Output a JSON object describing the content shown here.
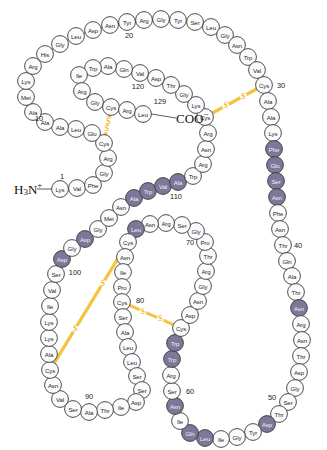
{
  "figure": {
    "molecule": "Lysozyme primary structure",
    "n_terminus_label": "H",
    "n_terminus_sub": "3",
    "n_terminus_rest": "N",
    "n_terminus_sup": "+",
    "c_terminus_label": "COO",
    "c_terminus_sup": "−",
    "disulfide_letter": "S"
  },
  "chart_data": {
    "type": "diagram",
    "residue_count": 129,
    "highlight_color": "#7d7799",
    "plain_color": "#fbfbfd",
    "disulfide_color": "#f5c33f",
    "sequence": [
      {
        "n": 1,
        "aa": "Lys",
        "hl": false,
        "x": 60,
        "y": 189
      },
      {
        "n": 2,
        "aa": "Val",
        "hl": false,
        "x": 77,
        "y": 188
      },
      {
        "n": 3,
        "aa": "Phe",
        "hl": false,
        "x": 93,
        "y": 185
      },
      {
        "n": 4,
        "aa": "Gly",
        "hl": false,
        "x": 104,
        "y": 173
      },
      {
        "n": 5,
        "aa": "Arg",
        "hl": false,
        "x": 108,
        "y": 158
      },
      {
        "n": 6,
        "aa": "Cys",
        "hl": false,
        "x": 104,
        "y": 143
      },
      {
        "n": 7,
        "aa": "Glu",
        "hl": false,
        "x": 92,
        "y": 133
      },
      {
        "n": 8,
        "aa": "Leu",
        "hl": false,
        "x": 76,
        "y": 129
      },
      {
        "n": 9,
        "aa": "Ala",
        "hl": false,
        "x": 60,
        "y": 127
      },
      {
        "n": 10,
        "aa": "Ala",
        "hl": false,
        "x": 45,
        "y": 122
      },
      {
        "n": 11,
        "aa": "Ala",
        "hl": false,
        "x": 33,
        "y": 112
      },
      {
        "n": 12,
        "aa": "Met",
        "hl": false,
        "x": 26,
        "y": 97
      },
      {
        "n": 13,
        "aa": "Lys",
        "hl": false,
        "x": 26,
        "y": 81
      },
      {
        "n": 14,
        "aa": "Arg",
        "hl": false,
        "x": 33,
        "y": 66
      },
      {
        "n": 15,
        "aa": "His",
        "hl": false,
        "x": 45,
        "y": 54
      },
      {
        "n": 16,
        "aa": "Gly",
        "hl": false,
        "x": 60,
        "y": 44
      },
      {
        "n": 17,
        "aa": "Leu",
        "hl": false,
        "x": 76,
        "y": 36
      },
      {
        "n": 18,
        "aa": "Asp",
        "hl": false,
        "x": 93,
        "y": 30
      },
      {
        "n": 19,
        "aa": "Asn",
        "hl": false,
        "x": 110,
        "y": 25
      },
      {
        "n": 20,
        "aa": "Tyr",
        "hl": false,
        "x": 127,
        "y": 22
      },
      {
        "n": 21,
        "aa": "Arg",
        "hl": false,
        "x": 144,
        "y": 20
      },
      {
        "n": 22,
        "aa": "Gly",
        "hl": false,
        "x": 161,
        "y": 19
      },
      {
        "n": 23,
        "aa": "Tyr",
        "hl": false,
        "x": 178,
        "y": 20
      },
      {
        "n": 24,
        "aa": "Ser",
        "hl": false,
        "x": 195,
        "y": 22
      },
      {
        "n": 25,
        "aa": "Leu",
        "hl": false,
        "x": 211,
        "y": 27
      },
      {
        "n": 26,
        "aa": "Gly",
        "hl": false,
        "x": 225,
        "y": 35
      },
      {
        "n": 27,
        "aa": "Asn",
        "hl": false,
        "x": 237,
        "y": 45
      },
      {
        "n": 28,
        "aa": "Trp",
        "hl": false,
        "x": 248,
        "y": 57
      },
      {
        "n": 29,
        "aa": "Val",
        "hl": false,
        "x": 257,
        "y": 70
      },
      {
        "n": 30,
        "aa": "Cys",
        "hl": false,
        "x": 264,
        "y": 85
      },
      {
        "n": 31,
        "aa": "Ala",
        "hl": false,
        "x": 268,
        "y": 101
      },
      {
        "n": 32,
        "aa": "Ala",
        "hl": false,
        "x": 271,
        "y": 117
      },
      {
        "n": 33,
        "aa": "Lys",
        "hl": false,
        "x": 273,
        "y": 133
      },
      {
        "n": 34,
        "aa": "Phe",
        "hl": true,
        "x": 274,
        "y": 149
      },
      {
        "n": 35,
        "aa": "Glu",
        "hl": true,
        "x": 275,
        "y": 165
      },
      {
        "n": 36,
        "aa": "Ser",
        "hl": true,
        "x": 276,
        "y": 181
      },
      {
        "n": 37,
        "aa": "Asn",
        "hl": true,
        "x": 277,
        "y": 197
      },
      {
        "n": 38,
        "aa": "Phe",
        "hl": false,
        "x": 278,
        "y": 213
      },
      {
        "n": 39,
        "aa": "Asn",
        "hl": false,
        "x": 280,
        "y": 229
      },
      {
        "n": 40,
        "aa": "Thr",
        "hl": false,
        "x": 283,
        "y": 245
      },
      {
        "n": 41,
        "aa": "Gln",
        "hl": false,
        "x": 287,
        "y": 261
      },
      {
        "n": 42,
        "aa": "Ala",
        "hl": false,
        "x": 292,
        "y": 276
      },
      {
        "n": 43,
        "aa": "Thr",
        "hl": false,
        "x": 296,
        "y": 292
      },
      {
        "n": 44,
        "aa": "Asn",
        "hl": true,
        "x": 299,
        "y": 308
      },
      {
        "n": 45,
        "aa": "Arg",
        "hl": false,
        "x": 301,
        "y": 324
      },
      {
        "n": 46,
        "aa": "Asn",
        "hl": false,
        "x": 302,
        "y": 340
      },
      {
        "n": 47,
        "aa": "Thr",
        "hl": false,
        "x": 301,
        "y": 356
      },
      {
        "n": 48,
        "aa": "Asp",
        "hl": false,
        "x": 299,
        "y": 372
      },
      {
        "n": 49,
        "aa": "Gly",
        "hl": false,
        "x": 295,
        "y": 388
      },
      {
        "n": 50,
        "aa": "Ser",
        "hl": false,
        "x": 288,
        "y": 402
      },
      {
        "n": 51,
        "aa": "Thr",
        "hl": false,
        "x": 279,
        "y": 414
      },
      {
        "n": 52,
        "aa": "Asp",
        "hl": true,
        "x": 267,
        "y": 424
      },
      {
        "n": 53,
        "aa": "Tyr",
        "hl": false,
        "x": 253,
        "y": 432
      },
      {
        "n": 54,
        "aa": "Gly",
        "hl": false,
        "x": 237,
        "y": 437
      },
      {
        "n": 55,
        "aa": "Ile",
        "hl": false,
        "x": 221,
        "y": 439
      },
      {
        "n": 56,
        "aa": "Leu",
        "hl": true,
        "x": 205,
        "y": 438
      },
      {
        "n": 57,
        "aa": "Gln",
        "hl": true,
        "x": 190,
        "y": 433
      },
      {
        "n": 58,
        "aa": "Ile",
        "hl": false,
        "x": 180,
        "y": 421
      },
      {
        "n": 59,
        "aa": "Asn",
        "hl": true,
        "x": 175,
        "y": 406
      },
      {
        "n": 60,
        "aa": "Ser",
        "hl": false,
        "x": 172,
        "y": 391
      },
      {
        "n": 61,
        "aa": "Arg",
        "hl": false,
        "x": 171,
        "y": 375
      },
      {
        "n": 62,
        "aa": "Trp",
        "hl": true,
        "x": 172,
        "y": 359
      },
      {
        "n": 63,
        "aa": "Trp",
        "hl": true,
        "x": 175,
        "y": 343
      },
      {
        "n": 64,
        "aa": "Cys",
        "hl": false,
        "x": 181,
        "y": 328
      },
      {
        "n": 65,
        "aa": "Asp",
        "hl": false,
        "x": 190,
        "y": 315
      },
      {
        "n": 66,
        "aa": "Asn",
        "hl": false,
        "x": 198,
        "y": 301
      },
      {
        "n": 67,
        "aa": "Gly",
        "hl": false,
        "x": 203,
        "y": 286
      },
      {
        "n": 68,
        "aa": "Arg",
        "hl": false,
        "x": 206,
        "y": 271
      },
      {
        "n": 69,
        "aa": "Thr",
        "hl": false,
        "x": 208,
        "y": 256
      },
      {
        "n": 70,
        "aa": "Pro",
        "hl": false,
        "x": 205,
        "y": 242
      },
      {
        "n": 71,
        "aa": "Gly",
        "hl": false,
        "x": 196,
        "y": 231
      },
      {
        "n": 72,
        "aa": "Ser",
        "hl": false,
        "x": 182,
        "y": 225
      },
      {
        "n": 73,
        "aa": "Arg",
        "hl": false,
        "x": 166,
        "y": 223
      },
      {
        "n": 74,
        "aa": "Asn",
        "hl": false,
        "x": 150,
        "y": 224
      },
      {
        "n": 75,
        "aa": "Leu",
        "hl": true,
        "x": 136,
        "y": 229
      },
      {
        "n": 76,
        "aa": "Cys",
        "hl": false,
        "x": 128,
        "y": 242
      },
      {
        "n": 77,
        "aa": "Asn",
        "hl": false,
        "x": 125,
        "y": 257
      },
      {
        "n": 78,
        "aa": "Ile",
        "hl": false,
        "x": 123,
        "y": 272
      },
      {
        "n": 79,
        "aa": "Pro",
        "hl": false,
        "x": 122,
        "y": 287
      },
      {
        "n": 80,
        "aa": "Cys",
        "hl": false,
        "x": 122,
        "y": 302
      },
      {
        "n": 81,
        "aa": "Ser",
        "hl": false,
        "x": 123,
        "y": 317
      },
      {
        "n": 82,
        "aa": "Ala",
        "hl": false,
        "x": 125,
        "y": 332
      },
      {
        "n": 83,
        "aa": "Leu",
        "hl": false,
        "x": 128,
        "y": 347
      },
      {
        "n": 84,
        "aa": "Leu",
        "hl": false,
        "x": 132,
        "y": 362
      },
      {
        "n": 85,
        "aa": "Ser",
        "hl": false,
        "x": 137,
        "y": 376
      },
      {
        "n": 86,
        "aa": "Ser",
        "hl": false,
        "x": 142,
        "y": 390
      },
      {
        "n": 87,
        "aa": "Asp",
        "hl": false,
        "x": 136,
        "y": 402
      },
      {
        "n": 88,
        "aa": "Ile",
        "hl": false,
        "x": 121,
        "y": 407
      },
      {
        "n": 89,
        "aa": "Thr",
        "hl": false,
        "x": 105,
        "y": 410
      },
      {
        "n": 90,
        "aa": "Ala",
        "hl": false,
        "x": 89,
        "y": 412
      },
      {
        "n": 91,
        "aa": "Ser",
        "hl": false,
        "x": 73,
        "y": 409
      },
      {
        "n": 92,
        "aa": "Val",
        "hl": false,
        "x": 60,
        "y": 399
      },
      {
        "n": 93,
        "aa": "Asn",
        "hl": false,
        "x": 53,
        "y": 385
      },
      {
        "n": 94,
        "aa": "Cys",
        "hl": false,
        "x": 50,
        "y": 370
      },
      {
        "n": 95,
        "aa": "Ala",
        "hl": false,
        "x": 49,
        "y": 354
      },
      {
        "n": 96,
        "aa": "Lys",
        "hl": false,
        "x": 49,
        "y": 338
      },
      {
        "n": 97,
        "aa": "Lys",
        "hl": false,
        "x": 49,
        "y": 322
      },
      {
        "n": 98,
        "aa": "Ile",
        "hl": false,
        "x": 50,
        "y": 306
      },
      {
        "n": 99,
        "aa": "Val",
        "hl": false,
        "x": 52,
        "y": 290
      },
      {
        "n": 100,
        "aa": "Ser",
        "hl": false,
        "x": 56,
        "y": 274
      },
      {
        "n": 101,
        "aa": "Asp",
        "hl": true,
        "x": 62,
        "y": 259
      },
      {
        "n": 102,
        "aa": "Gly",
        "hl": false,
        "x": 72,
        "y": 248
      },
      {
        "n": 103,
        "aa": "Asp",
        "hl": true,
        "x": 85,
        "y": 239
      },
      {
        "n": 104,
        "aa": "Gly",
        "hl": false,
        "x": 98,
        "y": 229
      },
      {
        "n": 105,
        "aa": "Met",
        "hl": false,
        "x": 109,
        "y": 218
      },
      {
        "n": 106,
        "aa": "Asn",
        "hl": false,
        "x": 121,
        "y": 207
      },
      {
        "n": 107,
        "aa": "Ala",
        "hl": true,
        "x": 134,
        "y": 198
      },
      {
        "n": 108,
        "aa": "Trp",
        "hl": true,
        "x": 148,
        "y": 191
      },
      {
        "n": 109,
        "aa": "Val",
        "hl": true,
        "x": 163,
        "y": 186
      },
      {
        "n": 110,
        "aa": "Ala",
        "hl": true,
        "x": 178,
        "y": 182
      },
      {
        "n": 111,
        "aa": "Trp",
        "hl": false,
        "x": 193,
        "y": 176
      },
      {
        "n": 112,
        "aa": "Arg",
        "hl": false,
        "x": 203,
        "y": 164
      },
      {
        "n": 113,
        "aa": "Asn",
        "hl": false,
        "x": 206,
        "y": 149
      },
      {
        "n": 114,
        "aa": "Arg",
        "hl": false,
        "x": 208,
        "y": 133
      },
      {
        "n": 115,
        "aa": "Cys",
        "hl": false,
        "x": 205,
        "y": 117
      },
      {
        "n": 116,
        "aa": "Lys",
        "hl": false,
        "x": 196,
        "y": 105
      },
      {
        "n": 117,
        "aa": "Gly",
        "hl": false,
        "x": 184,
        "y": 94
      },
      {
        "n": 118,
        "aa": "Thr",
        "hl": false,
        "x": 171,
        "y": 85
      },
      {
        "n": 119,
        "aa": "Asp",
        "hl": false,
        "x": 156,
        "y": 78
      },
      {
        "n": 120,
        "aa": "Val",
        "hl": false,
        "x": 140,
        "y": 73
      },
      {
        "n": 121,
        "aa": "Gln",
        "hl": false,
        "x": 124,
        "y": 69
      },
      {
        "n": 122,
        "aa": "Ala",
        "hl": false,
        "x": 108,
        "y": 66
      },
      {
        "n": 123,
        "aa": "Trp",
        "hl": false,
        "x": 93,
        "y": 68
      },
      {
        "n": 124,
        "aa": "Ile",
        "hl": false,
        "x": 79,
        "y": 75
      },
      {
        "n": 125,
        "aa": "Arg",
        "hl": false,
        "x": 82,
        "y": 91
      },
      {
        "n": 126,
        "aa": "Gly",
        "hl": false,
        "x": 95,
        "y": 102
      },
      {
        "n": 127,
        "aa": "Cys",
        "hl": false,
        "x": 111,
        "y": 107
      },
      {
        "n": 128,
        "aa": "Arg",
        "hl": false,
        "x": 127,
        "y": 110
      },
      {
        "n": 129,
        "aa": "Leu",
        "hl": false,
        "x": 143,
        "y": 114
      }
    ],
    "position_numbers": [
      {
        "label": "1",
        "x": 62,
        "y": 176
      },
      {
        "label": "10",
        "x": 39,
        "y": 118
      },
      {
        "label": "20",
        "x": 129,
        "y": 35
      },
      {
        "label": "30",
        "x": 281,
        "y": 85
      },
      {
        "label": "40",
        "x": 298,
        "y": 245
      },
      {
        "label": "50",
        "x": 272,
        "y": 397
      },
      {
        "label": "60",
        "x": 190,
        "y": 391
      },
      {
        "label": "70",
        "x": 190,
        "y": 242
      },
      {
        "label": "80",
        "x": 140,
        "y": 300
      },
      {
        "label": "90",
        "x": 89,
        "y": 396
      },
      {
        "label": "100",
        "x": 75,
        "y": 272
      },
      {
        "label": "110",
        "x": 176,
        "y": 196
      },
      {
        "label": "120",
        "x": 138,
        "y": 86
      },
      {
        "label": "129",
        "x": 160,
        "y": 101
      }
    ],
    "disulfide_bonds": [
      {
        "cys_a": 6,
        "cys_b": 127,
        "label": "S-S"
      },
      {
        "cys_a": 30,
        "cys_b": 115,
        "label": "S-S"
      },
      {
        "cys_a": 64,
        "cys_b": 80,
        "label": "S-S"
      },
      {
        "cys_a": 76,
        "cys_b": 94,
        "label": "S-S"
      }
    ],
    "highlighted_residues": [
      34,
      35,
      36,
      37,
      44,
      52,
      56,
      57,
      59,
      62,
      63,
      75,
      101,
      103,
      107,
      108,
      109,
      110
    ]
  }
}
